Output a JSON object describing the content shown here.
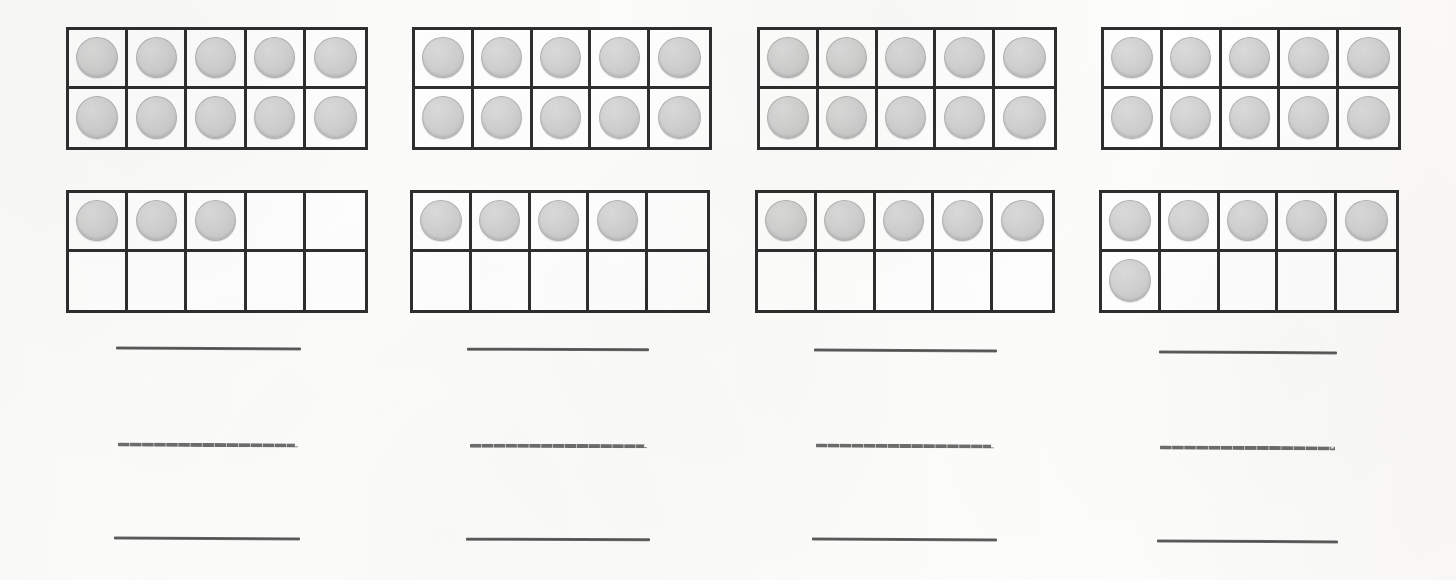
{
  "worksheet": {
    "title": "Ten Frame Counters Worksheet",
    "page_width": 1456,
    "page_height": 580,
    "background_color": "#fdfdfc",
    "frame_border_color": "#2e2e2e",
    "counter_color": "#d2d2d2",
    "counter_border_color": "#b3b3b3",
    "answer_line_color": "#5c5c5c",
    "columns": 4,
    "frames_per_problem": 2,
    "cells_per_frame": 10,
    "answer_lines_per_problem": 3
  },
  "problems": [
    {
      "id": "problem-1",
      "x": 66,
      "top_frame": {
        "name": "ten-frame-top",
        "x": 66,
        "y": 27,
        "width": 302,
        "height": 123,
        "filled_count": 10,
        "cells": [
          true,
          true,
          true,
          true,
          true,
          true,
          true,
          true,
          true,
          true
        ]
      },
      "bottom_frame": {
        "name": "ten-frame-bottom",
        "x": 66,
        "y": 190,
        "width": 302,
        "height": 123,
        "filled_count": 3,
        "cells": [
          true,
          true,
          true,
          false,
          false,
          false,
          false,
          false,
          false,
          false
        ]
      },
      "total": 13,
      "answer_lines": [
        {
          "name": "answer-line-top",
          "style": "solid",
          "x": 116,
          "y": 347,
          "width": 185,
          "skew": "skew-a"
        },
        {
          "name": "answer-line-middle",
          "style": "dashed",
          "x": 118,
          "y": 443,
          "width": 180,
          "skew": "skew-a"
        },
        {
          "name": "answer-line-bottom",
          "style": "solid",
          "x": 114,
          "y": 537,
          "width": 186,
          "skew": "skew-a"
        }
      ]
    },
    {
      "id": "problem-2",
      "x": 412,
      "top_frame": {
        "name": "ten-frame-top",
        "x": 412,
        "y": 27,
        "width": 300,
        "height": 123,
        "filled_count": 10,
        "cells": [
          true,
          true,
          true,
          true,
          true,
          true,
          true,
          true,
          true,
          true
        ]
      },
      "bottom_frame": {
        "name": "ten-frame-bottom",
        "x": 410,
        "y": 190,
        "width": 300,
        "height": 123,
        "filled_count": 4,
        "cells": [
          true,
          true,
          true,
          true,
          false,
          false,
          false,
          false,
          false,
          false
        ]
      },
      "total": 14,
      "answer_lines": [
        {
          "name": "answer-line-top",
          "style": "solid",
          "x": 467,
          "y": 348,
          "width": 182,
          "skew": "skew-b"
        },
        {
          "name": "answer-line-middle",
          "style": "dashed",
          "x": 470,
          "y": 444,
          "width": 177,
          "skew": "skew-b"
        },
        {
          "name": "answer-line-bottom",
          "style": "solid",
          "x": 466,
          "y": 538,
          "width": 184,
          "skew": "skew-b"
        }
      ]
    },
    {
      "id": "problem-3",
      "x": 757,
      "top_frame": {
        "name": "ten-frame-top",
        "x": 757,
        "y": 27,
        "width": 300,
        "height": 123,
        "filled_count": 10,
        "cells": [
          true,
          true,
          true,
          true,
          true,
          true,
          true,
          true,
          true,
          true
        ]
      },
      "bottom_frame": {
        "name": "ten-frame-bottom",
        "x": 755,
        "y": 190,
        "width": 300,
        "height": 123,
        "filled_count": 5,
        "cells": [
          true,
          true,
          true,
          true,
          true,
          false,
          false,
          false,
          false,
          false
        ]
      },
      "total": 15,
      "answer_lines": [
        {
          "name": "answer-line-top",
          "style": "solid",
          "x": 814,
          "y": 349,
          "width": 183,
          "skew": "skew-c"
        },
        {
          "name": "answer-line-middle",
          "style": "dashed",
          "x": 816,
          "y": 444,
          "width": 178,
          "skew": "skew-c"
        },
        {
          "name": "answer-line-bottom",
          "style": "solid",
          "x": 812,
          "y": 538,
          "width": 185,
          "skew": "skew-c"
        }
      ]
    },
    {
      "id": "problem-4",
      "x": 1101,
      "top_frame": {
        "name": "ten-frame-top",
        "x": 1101,
        "y": 27,
        "width": 300,
        "height": 123,
        "filled_count": 10,
        "cells": [
          true,
          true,
          true,
          true,
          true,
          true,
          true,
          true,
          true,
          true
        ]
      },
      "bottom_frame": {
        "name": "ten-frame-bottom",
        "x": 1099,
        "y": 190,
        "width": 300,
        "height": 123,
        "filled_count": 6,
        "cells": [
          true,
          true,
          true,
          true,
          true,
          true,
          false,
          false,
          false,
          false
        ]
      },
      "total": 16,
      "answer_lines": [
        {
          "name": "answer-line-top",
          "style": "solid",
          "x": 1159,
          "y": 351,
          "width": 178,
          "skew": "skew-d"
        },
        {
          "name": "answer-line-middle",
          "style": "dashed",
          "x": 1160,
          "y": 446,
          "width": 175,
          "skew": "skew-d"
        },
        {
          "name": "answer-line-bottom",
          "style": "solid",
          "x": 1157,
          "y": 540,
          "width": 181,
          "skew": "skew-d"
        }
      ]
    }
  ]
}
